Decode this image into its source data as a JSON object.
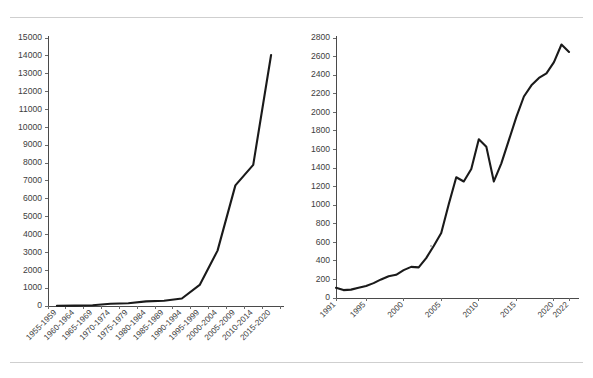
{
  "page": {
    "background_color": "#ffffff",
    "rule_color": "#cfcfcf",
    "line_color": "#1a1a1a",
    "axis_color": "#4a4a4a",
    "label_color": "#3d3d3d"
  },
  "chart_data": [
    {
      "id": "left-chart",
      "type": "line",
      "title": "",
      "xlabel": "",
      "ylabel": "",
      "categories": [
        "1955-1959",
        "1960-1964",
        "1965-1969",
        "1970-1974",
        "1975-1979",
        "1980-1984",
        "1985-1989",
        "1990-1994",
        "1995-1999",
        "2000-2004",
        "2005-2009",
        "2010-2014",
        "2015-2020"
      ],
      "values": [
        10,
        20,
        40,
        130,
        150,
        260,
        290,
        420,
        1180,
        3100,
        6750,
        7900,
        14050
      ],
      "ylim": [
        0,
        15000
      ],
      "yticks": [
        0,
        1000,
        2000,
        3000,
        4000,
        5000,
        6000,
        7000,
        8000,
        9000,
        10000,
        11000,
        12000,
        13000,
        14000,
        15000
      ],
      "ytick_labels": [
        "0",
        "1000",
        "2000",
        "3000",
        "4000",
        "5000",
        "6000",
        "7000",
        "8000",
        "9000",
        "10000",
        "11000",
        "12000",
        "13000",
        "14000",
        "15000"
      ],
      "xtick_labels": [
        "1955-1959",
        "1960-1964",
        "1965-1969",
        "1970-1974",
        "1975-1979",
        "1980-1984",
        "1985-1989",
        "1990-1994",
        "1995-1999",
        "2000-2004",
        "2005-2009",
        "2010-2014",
        "2015-2020"
      ],
      "grid": false,
      "legend": false
    },
    {
      "id": "right-chart",
      "type": "line",
      "title": "",
      "xlabel": "",
      "ylabel": "",
      "x": [
        1991,
        1992,
        1993,
        1994,
        1995,
        1996,
        1997,
        1998,
        1999,
        2000,
        2001,
        2002,
        2003,
        2004,
        2005,
        2006,
        2007,
        2008,
        2009,
        2010,
        2011,
        2012,
        2013,
        2014,
        2015,
        2016,
        2017,
        2018,
        2019,
        2020,
        2021,
        2022
      ],
      "values": [
        110,
        85,
        90,
        110,
        130,
        160,
        200,
        235,
        250,
        300,
        335,
        330,
        430,
        560,
        700,
        1010,
        1300,
        1255,
        1390,
        1710,
        1630,
        1255,
        1450,
        1700,
        1950,
        2170,
        2290,
        2370,
        2420,
        2540,
        2730,
        2650
      ],
      "ylim": [
        0,
        2800
      ],
      "yticks": [
        0,
        200,
        400,
        600,
        800,
        1000,
        1200,
        1400,
        1600,
        1800,
        2000,
        2200,
        2400,
        2600,
        2800
      ],
      "ytick_labels": [
        "0",
        "200",
        "400",
        "600",
        "800",
        "1000",
        "1200",
        "1400",
        "1600",
        "1800",
        "2000",
        "2200",
        "2400",
        "2600",
        "2800"
      ],
      "xticks": [
        1991,
        1995,
        2000,
        2005,
        2010,
        2015,
        2020,
        2022
      ],
      "xtick_labels": [
        "1991",
        "1995",
        "2000",
        "2005",
        "2010",
        "2015",
        "2020",
        "2022"
      ],
      "grid": false,
      "legend": false
    }
  ]
}
